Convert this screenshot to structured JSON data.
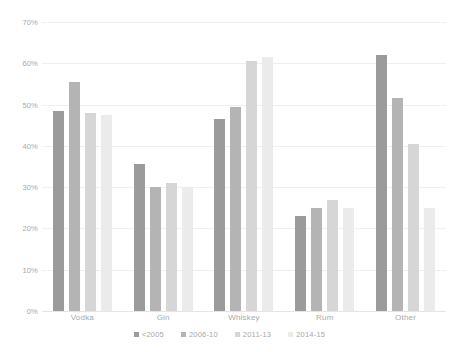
{
  "chart_data": {
    "type": "bar",
    "title": "",
    "xlabel": "",
    "ylabel": "",
    "ylim": [
      0,
      70
    ],
    "grid": true,
    "legend_position": "bottom",
    "categories": [
      "Vodka",
      "Gin",
      "Whiskey",
      "Rum",
      "Other"
    ],
    "ytick_labels": [
      "70%",
      "60%",
      "50%",
      "40%",
      "30%",
      "20%",
      "10%",
      "0%"
    ],
    "ytick_values": [
      70,
      60,
      50,
      40,
      30,
      20,
      10,
      0
    ],
    "series": [
      {
        "name": "<2005",
        "color": "#9b9b9b",
        "values": [
          48.5,
          35.5,
          46.5,
          23.0,
          62.0
        ]
      },
      {
        "name": "2006-10",
        "color": "#b4b4b4",
        "values": [
          55.5,
          30.0,
          49.5,
          25.0,
          51.5
        ]
      },
      {
        "name": "2011-13",
        "color": "#d6d6d6",
        "values": [
          48.0,
          31.0,
          60.5,
          27.0,
          40.5
        ]
      },
      {
        "name": "2014-15",
        "color": "#ebebeb",
        "values": [
          47.5,
          30.0,
          61.5,
          25.0,
          25.0
        ]
      }
    ]
  }
}
